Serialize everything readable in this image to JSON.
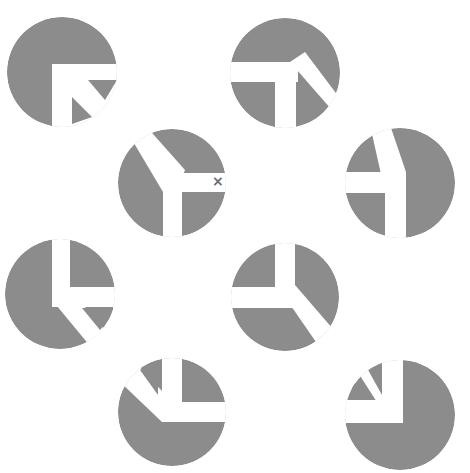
{
  "figure": {
    "width": 470,
    "height": 473,
    "background": "#ffffff",
    "disk_color": "#8c8c8c",
    "cut_color": "#ffffff",
    "marker_color": "#6e6e6e"
  },
  "marker": {
    "symbol": "×",
    "on_disk": 3,
    "x": 212,
    "y": 174
  },
  "disks": [
    {
      "id": 1,
      "cx": 62,
      "cy": 72,
      "r": 55,
      "cuts": [
        "52,64 125,64 125,130 52,130"
      ],
      "inner": [
        "88,80 117,80 105,100",
        "72,97 72,124 92,117"
      ]
    },
    {
      "id": 2,
      "cx": 285,
      "cy": 73,
      "r": 55,
      "cuts": [
        "225,62 298,62 298,82 225,82",
        "275,82 296,82 296,135 275,135",
        "290,62 305,52 345,105 345,125"
      ],
      "inner": [
        "296,88 296,123 320,113"
      ]
    },
    {
      "id": 3,
      "cx": 172,
      "cy": 183,
      "r": 54,
      "cuts": [
        "125,128 145,125 185,170 176,192 163,192",
        "163,173 232,173 232,192 163,192",
        "163,173 182,173 182,240 163,240"
      ],
      "inner": []
    },
    {
      "id": 4,
      "cx": 400,
      "cy": 183,
      "r": 55,
      "cuts": [
        "340,172 405,172 405,193 340,193",
        "385,172 406,172 406,242 385,242",
        "370,125 390,125 406,172 385,192"
      ],
      "inner": [
        "352,160 370,155 378,172 352,172"
      ]
    },
    {
      "id": 5,
      "cx": 60,
      "cy": 294,
      "r": 55,
      "cuts": [
        "52,235 70,235 70,307 52,307",
        "52,287 120,287 120,307 52,307",
        "52,300 70,290 118,345 95,352"
      ],
      "inner": [
        "82,308 118,308 100,330"
      ]
    },
    {
      "id": 6,
      "cx": 285,
      "cy": 297,
      "r": 54,
      "cuts": [
        "275,240 295,240 295,308 275,308",
        "225,287 295,287 295,308 225,308",
        "280,290 295,285 345,343 325,355"
      ],
      "inner": []
    },
    {
      "id": 7,
      "cx": 172,
      "cy": 412,
      "r": 54,
      "cuts": [
        "162,352 182,352 182,422 162,422",
        "162,402 232,402 232,422 162,422",
        "118,380 135,362 175,405 162,422"
      ],
      "inner": [
        "140,370 158,360 158,395"
      ]
    },
    {
      "id": 8,
      "cx": 400,
      "cy": 415,
      "r": 55,
      "cuts": [
        "382,352 403,352 403,423 382,423",
        "340,400 403,400 403,423 340,423",
        "350,360 370,358 403,400 382,410"
      ],
      "inner": [
        "367,368 382,362 382,395",
        "352,380 365,398 352,398"
      ]
    }
  ]
}
